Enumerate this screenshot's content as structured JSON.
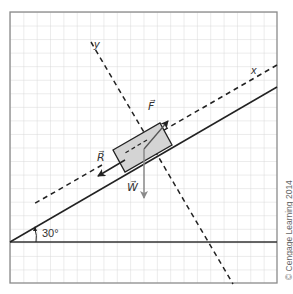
{
  "diagram": {
    "incline_angle_label": "30°",
    "axes": {
      "x_label": "x",
      "y_label": "y"
    },
    "forces": [
      {
        "symbol": "F",
        "label": "F⃗",
        "direction": "up the incline"
      },
      {
        "symbol": "R",
        "label": "R⃗",
        "direction": "down the incline"
      },
      {
        "symbol": "W",
        "label": "W⃗",
        "direction": "vertically downward"
      }
    ],
    "colors": {
      "grid": "#d8d8d8",
      "frame": "#8a8a8a",
      "lines": "#222222",
      "block_fill": "#d4d4d4",
      "weight_arrow": "#8a8a8a"
    }
  },
  "credit": "© Cengage Learning 2014"
}
